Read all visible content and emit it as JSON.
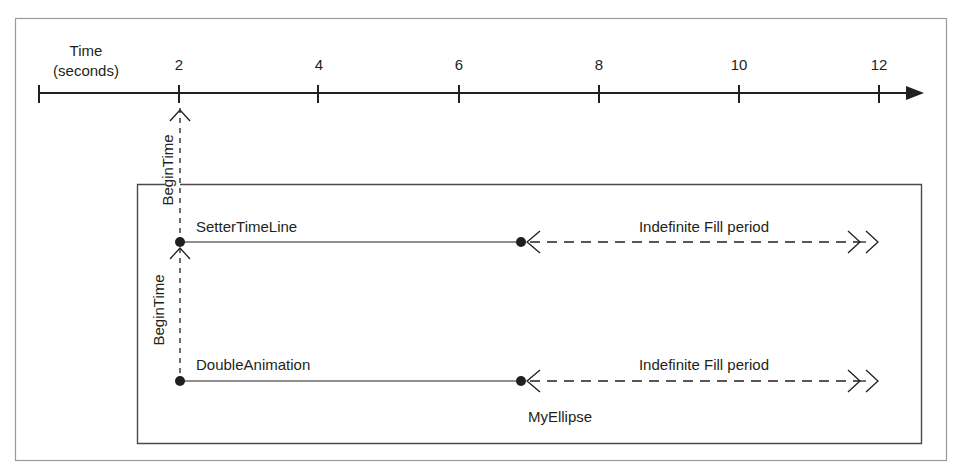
{
  "axis": {
    "title_line1": "Time",
    "title_line2": "(seconds)",
    "ticks": [
      "2",
      "4",
      "6",
      "8",
      "10",
      "12"
    ]
  },
  "container": {
    "label": "MyEllipse"
  },
  "timelines": [
    {
      "name": "SetterTimeLine",
      "begin_label": "BeginTime",
      "fill_label": "Indefinite Fill period"
    },
    {
      "name": "DoubleAnimation",
      "begin_label": "BeginTime",
      "fill_label": "Indefinite Fill period"
    }
  ],
  "colors": {
    "stroke": "#231f20",
    "frame": "#9a9a9a",
    "box": "#4a4a4a"
  }
}
